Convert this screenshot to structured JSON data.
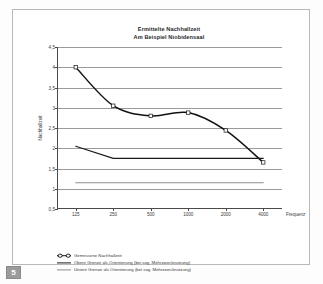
{
  "page": {
    "badge_number": "5"
  },
  "chart_data": {
    "type": "line",
    "title": "Ermittelte Nachhallzeit",
    "subtitle": "Am Beispiel Niobidensaal",
    "xlabel": "Frequenz",
    "ylabel": "Nachhallzeit",
    "categories": [
      "125",
      "250",
      "500",
      "1000",
      "2000",
      "4000"
    ],
    "ylim": [
      0.5,
      4.5
    ],
    "yticks": [
      "4,5",
      "4",
      "3,5",
      "3",
      "2,5",
      "2",
      "1,5",
      "1",
      "0,5"
    ],
    "ytick_values": [
      4.5,
      4,
      3.5,
      3,
      2.5,
      2,
      1.5,
      1,
      0.5
    ],
    "grid": true,
    "legend_position": "below",
    "series": [
      {
        "name": "Gemessene Nachhallzeit",
        "values": [
          4.0,
          3.05,
          2.8,
          2.88,
          2.44,
          1.65
        ],
        "color": "#111111",
        "markers": true
      },
      {
        "name": "Obere Grenze als Orientierung (bei sog. Mehrzwecknutzung)",
        "values": [
          2.05,
          1.75,
          1.75,
          1.75,
          1.75,
          1.75
        ],
        "color": "#1a1a1a",
        "markers": false
      },
      {
        "name": "Untere Grenze als Orientierung (bei sog. Mehrzwecknutzung)",
        "values": [
          1.15,
          1.15,
          1.15,
          1.15,
          1.15,
          1.15
        ],
        "color": "#8e8e8e",
        "markers": false
      }
    ]
  }
}
